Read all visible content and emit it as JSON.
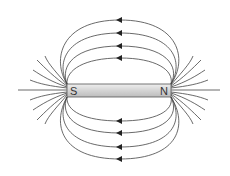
{
  "diagram": {
    "magnet": {
      "south_label": "S",
      "north_label": "N",
      "fill_color": "#d6d6d6",
      "stroke_color": "#555555"
    },
    "field_lines": {
      "color": "#444444",
      "arrow_direction": "left",
      "upper_loops": 4,
      "lower_loops": 4,
      "flare_lines_per_end": 9
    }
  }
}
